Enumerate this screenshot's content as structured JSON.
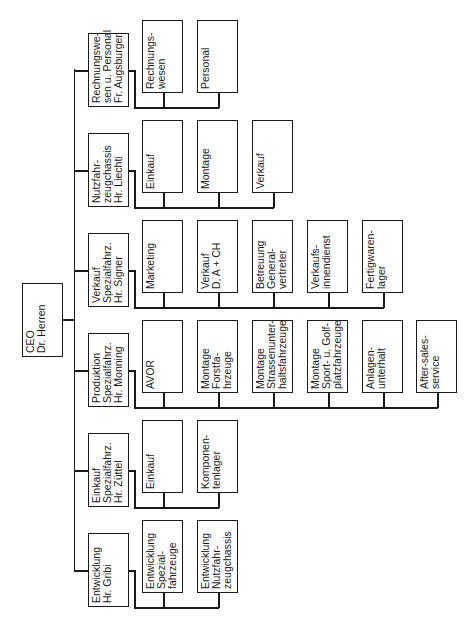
{
  "chart": {
    "ceo": {
      "lines": [
        "CEO",
        "Dr. Herren"
      ]
    },
    "departments": [
      {
        "id": "rechnungswesen",
        "lines": [
          "Rechnungswe-",
          "sen u. Personal",
          "Fr. Augsburger"
        ],
        "children": [
          {
            "lines": [
              "Rechnungs-",
              "wesen"
            ]
          },
          {
            "lines": [
              "Personal"
            ]
          }
        ]
      },
      {
        "id": "nutzfahrzeugchassis",
        "lines": [
          "Nutzfahr-",
          "zeugchassis",
          "Hr. Liechti"
        ],
        "children": [
          {
            "lines": [
              "Einkauf"
            ]
          },
          {
            "lines": [
              "Montage"
            ]
          },
          {
            "lines": [
              "Verkauf"
            ]
          }
        ]
      },
      {
        "id": "verkauf-spezialfahrz",
        "lines": [
          "Verkauf",
          "Spezialfahrz.",
          "Hr. Signer"
        ],
        "children": [
          {
            "lines": [
              "Marketing"
            ]
          },
          {
            "lines": [
              "Verkauf",
              "D, A + CH"
            ]
          },
          {
            "lines": [
              "Betreuung",
              "General-",
              "vertreter"
            ]
          },
          {
            "lines": [
              "Verkaufs-",
              "innendienst"
            ]
          },
          {
            "lines": [
              "Fertigwaren-",
              "lager"
            ]
          }
        ]
      },
      {
        "id": "produktion-spezialfahrz",
        "lines": [
          "Produktion",
          "Spezialfahrz.",
          "Hr. Monning"
        ],
        "children": [
          {
            "lines": [
              "AVOR"
            ]
          },
          {
            "lines": [
              "Montage",
              "Forstfa-",
              "hrzeuge"
            ]
          },
          {
            "lines": [
              "Montage",
              "Strassenunter-",
              "haltsfahrzeuge"
            ]
          },
          {
            "lines": [
              "Montage",
              "Sport- u. Golf-",
              "platzfahrzeuge"
            ]
          },
          {
            "lines": [
              "Anlagen-",
              "unterhalt"
            ]
          },
          {
            "lines": [
              "After-sales-",
              "service"
            ]
          }
        ]
      },
      {
        "id": "einkauf-spezialfahrz",
        "lines": [
          "Einkauf",
          "Spezialfahrz.",
          "Hr. Züttel"
        ],
        "children": [
          {
            "lines": [
              "Einkauf"
            ]
          },
          {
            "lines": [
              "Komponen-",
              "tenlager"
            ]
          }
        ]
      },
      {
        "id": "entwicklung",
        "lines": [
          "Entwicklung",
          "Hr. Gribi"
        ],
        "children": [
          {
            "lines": [
              "Entwicklung",
              "Spezial-",
              "fahrzeuge"
            ]
          },
          {
            "lines": [
              "Entwicklung",
              "Nutzfahr-",
              "zeugchassis"
            ]
          }
        ]
      }
    ]
  },
  "colors": {
    "line": "#1a1a1a",
    "background": "#ffffff"
  }
}
